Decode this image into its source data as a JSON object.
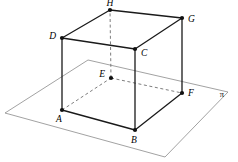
{
  "figure": {
    "type": "geometric-diagram",
    "colors": {
      "solid_edge": "#1a1a1a",
      "hidden_edge": "#6e6e6e",
      "plane_edge": "#8a8a8a",
      "vertex": "#111111",
      "background": "#ffffff"
    }
  },
  "plane": {
    "label": "π",
    "label_pos": {
      "x": 222,
      "y": 95
    },
    "corners": [
      {
        "name": "plane-corner-top",
        "x": 88,
        "y": 60
      },
      {
        "name": "plane-corner-right",
        "x": 228,
        "y": 92
      },
      {
        "name": "plane-corner-bottom",
        "x": 165,
        "y": 157
      },
      {
        "name": "plane-corner-left",
        "x": 5,
        "y": 113
      }
    ]
  },
  "vertices": [
    {
      "label": "A",
      "x": 62,
      "y": 110,
      "label_x": 59,
      "label_y": 120,
      "anchor": "middle"
    },
    {
      "label": "B",
      "x": 135,
      "y": 130,
      "label_x": 134,
      "label_y": 141,
      "anchor": "middle"
    },
    {
      "label": "C",
      "x": 135,
      "y": 49,
      "label_x": 141,
      "label_y": 54,
      "anchor": "start"
    },
    {
      "label": "D",
      "x": 62,
      "y": 38,
      "label_x": 56,
      "label_y": 37,
      "anchor": "end"
    },
    {
      "label": "E",
      "x": 111,
      "y": 78,
      "label_x": 105,
      "label_y": 75,
      "anchor": "end"
    },
    {
      "label": "F",
      "x": 182,
      "y": 93,
      "label_x": 188,
      "label_y": 94,
      "anchor": "start"
    },
    {
      "label": "G",
      "x": 182,
      "y": 18,
      "label_x": 188,
      "label_y": 20,
      "anchor": "start"
    },
    {
      "label": "H",
      "x": 110,
      "y": 10,
      "label_x": 110,
      "label_y": 4,
      "anchor": "middle"
    }
  ],
  "edges": {
    "solid": [
      {
        "name": "edge-A-B",
        "from": "A",
        "to": "B"
      },
      {
        "name": "edge-B-F",
        "from": "B",
        "to": "F"
      },
      {
        "name": "edge-A-D",
        "from": "A",
        "to": "D"
      },
      {
        "name": "edge-B-C",
        "from": "B",
        "to": "C"
      },
      {
        "name": "edge-F-G",
        "from": "F",
        "to": "G"
      },
      {
        "name": "edge-D-C",
        "from": "D",
        "to": "C"
      },
      {
        "name": "edge-C-G",
        "from": "C",
        "to": "G"
      },
      {
        "name": "edge-D-H",
        "from": "D",
        "to": "H"
      },
      {
        "name": "edge-H-G",
        "from": "H",
        "to": "G"
      }
    ],
    "hidden": [
      {
        "name": "edge-A-E",
        "from": "A",
        "to": "E"
      },
      {
        "name": "edge-E-F",
        "from": "E",
        "to": "F"
      },
      {
        "name": "edge-E-H",
        "from": "E",
        "to": "H"
      }
    ]
  }
}
